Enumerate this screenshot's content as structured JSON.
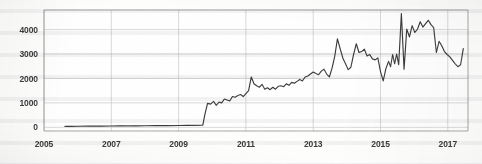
{
  "chart_data": {
    "type": "line",
    "title": "",
    "subtitle": "",
    "xlabel": "",
    "ylabel": "",
    "xlim": [
      2005.0,
      2017.6
    ],
    "ylim": [
      -150,
      4800
    ],
    "grid": true,
    "legend": null,
    "legend_position": "none",
    "line_color": "#3b3b3b",
    "grid_color": "#c9c9c9",
    "axis_color": "#8f8f8f",
    "x_ticks": [
      2005,
      2007,
      2009,
      2011,
      2013,
      2015,
      2017
    ],
    "x_tick_labels": [
      "2005",
      "2007",
      "2009",
      "2011",
      "2013",
      "2015",
      "2017"
    ],
    "y_ticks": [
      0,
      1000,
      2000,
      3000,
      4000
    ],
    "y_tick_labels": [
      "0",
      "1000",
      "2000",
      "3000",
      "4000"
    ],
    "annotations": [],
    "series": [
      {
        "name": "series-1",
        "x": [
          2005.62,
          2005.8,
          2006.0,
          2006.25,
          2006.5,
          2006.75,
          2007.0,
          2007.25,
          2007.5,
          2007.75,
          2008.0,
          2008.25,
          2008.5,
          2008.75,
          2009.0,
          2009.25,
          2009.5,
          2009.66,
          2009.72,
          2009.78,
          2009.86,
          2009.95,
          2010.04,
          2010.12,
          2010.2,
          2010.28,
          2010.36,
          2010.44,
          2010.52,
          2010.6,
          2010.68,
          2010.76,
          2010.84,
          2010.92,
          2011.0,
          2011.08,
          2011.16,
          2011.24,
          2011.32,
          2011.4,
          2011.48,
          2011.56,
          2011.64,
          2011.72,
          2011.8,
          2011.88,
          2011.96,
          2012.04,
          2012.12,
          2012.2,
          2012.28,
          2012.36,
          2012.44,
          2012.52,
          2012.6,
          2012.68,
          2012.76,
          2012.84,
          2012.92,
          2013.0,
          2013.08,
          2013.16,
          2013.24,
          2013.32,
          2013.4,
          2013.48,
          2013.56,
          2013.64,
          2013.72,
          2013.8,
          2013.88,
          2013.96,
          2014.04,
          2014.12,
          2014.2,
          2014.28,
          2014.36,
          2014.44,
          2014.52,
          2014.6,
          2014.68,
          2014.76,
          2014.84,
          2014.92,
          2015.0,
          2015.08,
          2015.16,
          2015.24,
          2015.3,
          2015.36,
          2015.42,
          2015.48,
          2015.54,
          2015.62,
          2015.7,
          2015.78,
          2015.86,
          2015.94,
          2016.02,
          2016.1,
          2016.18,
          2016.26,
          2016.34,
          2016.42,
          2016.5,
          2016.58,
          2016.66,
          2016.74,
          2016.82,
          2016.9,
          2016.98,
          2017.06,
          2017.14,
          2017.22,
          2017.3,
          2017.38,
          2017.46
        ],
        "y": [
          40,
          42,
          45,
          48,
          50,
          52,
          55,
          58,
          60,
          62,
          65,
          68,
          70,
          72,
          75,
          78,
          80,
          85,
          90,
          520,
          980,
          950,
          1060,
          900,
          1030,
          1000,
          1160,
          1120,
          1080,
          1260,
          1230,
          1300,
          1340,
          1260,
          1380,
          1500,
          2060,
          1780,
          1700,
          1640,
          1760,
          1560,
          1620,
          1540,
          1640,
          1560,
          1680,
          1700,
          1660,
          1780,
          1720,
          1840,
          1800,
          1880,
          1960,
          1900,
          2060,
          2100,
          2180,
          2260,
          2200,
          2150,
          2300,
          2380,
          2180,
          2060,
          2420,
          2900,
          3620,
          3220,
          2840,
          2600,
          2360,
          2460,
          2980,
          3420,
          3060,
          3100,
          3200,
          2920,
          2980,
          2800,
          2760,
          2840,
          2280,
          1900,
          2400,
          2700,
          2480,
          2980,
          2600,
          3000,
          2560,
          4650,
          2380,
          4020,
          3700,
          4160,
          3880,
          4020,
          4320,
          4100,
          4240,
          4380,
          4200,
          4080,
          3060,
          3520,
          3340,
          3100,
          2980,
          2880,
          2740,
          2600,
          2480,
          2560,
          3220
        ]
      }
    ]
  },
  "axes": {
    "y_axis_name": "value-axis",
    "x_axis_name": "year-axis"
  }
}
